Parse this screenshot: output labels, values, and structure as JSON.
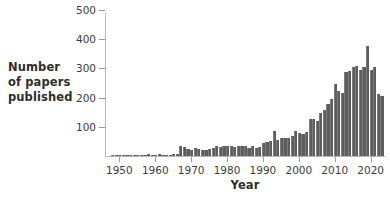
{
  "chart_data": {
    "type": "bar",
    "title": "",
    "xlabel": "Year",
    "ylabel_lines": [
      "Number",
      "of papers",
      "published"
    ],
    "ylabel": "Number of papers published",
    "grid": false,
    "legend": "none",
    "bar_color": "#5d5d5d",
    "axis_color": "#b9b9b9",
    "xlim": [
      1946,
      2024
    ],
    "ylim": [
      0,
      500
    ],
    "yticks": [
      100,
      200,
      300,
      400,
      500
    ],
    "ytick_labels": [
      "100",
      "200",
      "300",
      "400",
      "500"
    ],
    "xticks": [
      1950,
      1960,
      1970,
      1980,
      1990,
      2000,
      2010,
      2020
    ],
    "xtick_labels": [
      "1950",
      "1960",
      "1970",
      "1980",
      "1990",
      "2000",
      "2010",
      "2020"
    ],
    "x": [
      1948,
      1949,
      1950,
      1951,
      1952,
      1953,
      1954,
      1955,
      1956,
      1957,
      1958,
      1959,
      1960,
      1961,
      1962,
      1963,
      1964,
      1965,
      1966,
      1967,
      1968,
      1969,
      1970,
      1971,
      1972,
      1973,
      1974,
      1975,
      1976,
      1977,
      1978,
      1979,
      1980,
      1981,
      1982,
      1983,
      1984,
      1985,
      1986,
      1987,
      1988,
      1989,
      1990,
      1991,
      1992,
      1993,
      1994,
      1995,
      1996,
      1997,
      1998,
      1999,
      2000,
      2001,
      2002,
      2003,
      2004,
      2005,
      2006,
      2007,
      2008,
      2009,
      2010,
      2011,
      2012,
      2013,
      2014,
      2015,
      2016,
      2017,
      2018,
      2019,
      2020,
      2021,
      2022,
      2023
    ],
    "values": [
      1,
      1,
      2,
      2,
      3,
      4,
      2,
      3,
      3,
      5,
      6,
      4,
      5,
      6,
      4,
      3,
      4,
      6,
      8,
      34,
      30,
      24,
      22,
      26,
      23,
      20,
      22,
      25,
      29,
      34,
      30,
      33,
      36,
      33,
      31,
      36,
      35,
      33,
      28,
      34,
      26,
      31,
      44,
      48,
      52,
      86,
      56,
      60,
      63,
      60,
      68,
      84,
      79,
      77,
      83,
      128,
      127,
      121,
      146,
      156,
      178,
      196,
      248,
      223,
      216,
      287,
      290,
      305,
      309,
      294,
      305,
      377,
      293,
      304,
      213,
      205
    ],
    "series_name": "Number of papers published"
  }
}
